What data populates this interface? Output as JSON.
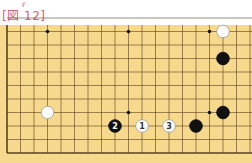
{
  "title": {
    "text": "[図 12]",
    "ruby": "ず",
    "color": "#d4607a"
  },
  "board": {
    "background": "#f7d98e",
    "line_color": "#5a4020",
    "grid_spacing": 13.5,
    "origin": {
      "x": 7,
      "y": 153
    },
    "cols_visible": 19,
    "rows_visible": 10,
    "star_points": [
      [
        3,
        9
      ],
      [
        9,
        9
      ],
      [
        15,
        9
      ],
      [
        9,
        3
      ],
      [
        15,
        3
      ]
    ],
    "stones": [
      {
        "color": "white",
        "col": 16,
        "row": 9,
        "label": ""
      },
      {
        "color": "black",
        "col": 16,
        "row": 7,
        "label": ""
      },
      {
        "color": "white",
        "col": 3,
        "row": 3,
        "label": ""
      },
      {
        "color": "black",
        "col": 16,
        "row": 3,
        "label": ""
      },
      {
        "color": "black",
        "col": 8,
        "row": 2,
        "label": "2"
      },
      {
        "color": "white",
        "col": 10,
        "row": 2,
        "label": "1"
      },
      {
        "color": "white",
        "col": 12,
        "row": 2,
        "label": "3"
      },
      {
        "color": "black",
        "col": 14,
        "row": 2,
        "label": ""
      }
    ]
  }
}
